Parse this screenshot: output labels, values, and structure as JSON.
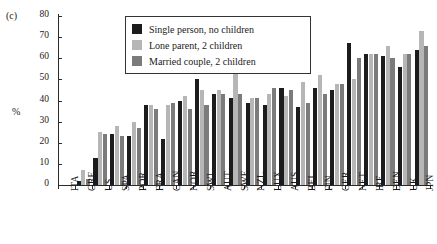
{
  "panel_label": "(c)",
  "y_axis_title": "%",
  "legend": {
    "items": [
      {
        "label": "Single person, no children",
        "color": "#1c1c1c"
      },
      {
        "label": "Lone parent, 2 children",
        "color": "#b6b6b6"
      },
      {
        "label": "Married couple, 2 children",
        "color": "#7b7b7b"
      }
    ]
  },
  "chart_data": {
    "type": "bar",
    "title": "",
    "xlabel": "",
    "ylabel": "%",
    "ylim": [
      0,
      80
    ],
    "yticks": [
      0,
      10,
      20,
      30,
      40,
      50,
      60,
      70,
      80
    ],
    "grid": false,
    "legend_position": "top-center",
    "categories": [
      "ITA",
      "GRE",
      "US",
      "SPA",
      "POR",
      "FRA",
      "CAN",
      "NOR",
      "SWI",
      "AUT",
      "SWE",
      "NZL",
      "LUX",
      "AUS",
      "BEL",
      "FIN",
      "GER",
      "NET",
      "IRE",
      "DEN",
      "UK",
      "JPN"
    ],
    "series": [
      {
        "name": "Single person, no children",
        "color": "#1c1c1c",
        "values": [
          0,
          2,
          13,
          24,
          23,
          38,
          22,
          40,
          50,
          43,
          41,
          39,
          38,
          46,
          37,
          46,
          45,
          67,
          62,
          61,
          56,
          64
        ]
      },
      {
        "name": "Lone parent, 2 children",
        "color": "#b6b6b6",
        "values": [
          0,
          7,
          25,
          28,
          30,
          38,
          38,
          42,
          45,
          45,
          53,
          41,
          43,
          42,
          49,
          52,
          48,
          50,
          62,
          66,
          62,
          73
        ]
      },
      {
        "name": "Married couple, 2 children",
        "color": "#7b7b7b",
        "values": [
          0,
          3,
          24,
          23,
          27,
          36,
          39,
          36,
          38,
          43,
          43,
          41,
          46,
          45,
          39,
          43,
          48,
          60,
          62,
          60,
          62,
          66
        ]
      }
    ]
  }
}
